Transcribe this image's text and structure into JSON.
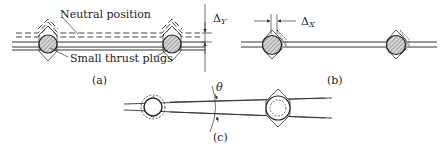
{
  "figure": {
    "panels": [
      {
        "id": "a",
        "caption": "(a)",
        "labels": {
          "neutral": "Neutral position",
          "plugs": "Small thrust plugs",
          "delta": "Δ",
          "delta_sub": "Y"
        }
      },
      {
        "id": "b",
        "caption": "(b)",
        "labels": {
          "delta": "Δ",
          "delta_sub": "X"
        }
      },
      {
        "id": "c",
        "caption": "(c)",
        "labels": {
          "angle": "θ"
        }
      }
    ],
    "colors": {
      "line": "#333333",
      "hatch": "#777777"
    }
  }
}
